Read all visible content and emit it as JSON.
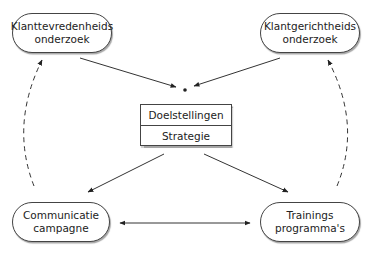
{
  "diagram": {
    "nodes": {
      "top_left": {
        "line1": "Klanttevredenheids",
        "line2": "onderzoek"
      },
      "top_right": {
        "line1": "Klantgerichtheids",
        "line2": "onderzoek"
      },
      "bottom_left": {
        "line1": "Communicatie",
        "line2": "campagne"
      },
      "bottom_right": {
        "line1": "Trainings",
        "line2": "programma's"
      }
    },
    "center": {
      "rows": [
        "Doelstellingen",
        "Strategie"
      ]
    },
    "edges": [
      {
        "from": "top_left",
        "to": "center_dot",
        "style": "solid"
      },
      {
        "from": "top_right",
        "to": "center_dot",
        "style": "solid"
      },
      {
        "from": "center",
        "to": "bottom_left",
        "style": "solid"
      },
      {
        "from": "center",
        "to": "bottom_right",
        "style": "solid"
      },
      {
        "from": "bottom_left",
        "to": "bottom_right",
        "style": "solid",
        "bidirectional": true
      },
      {
        "from": "bottom_left",
        "to": "top_left",
        "style": "dashed-curved"
      },
      {
        "from": "bottom_right",
        "to": "top_right",
        "style": "dashed-curved"
      }
    ],
    "colors": {
      "stroke": "#333333",
      "background": "#ffffff"
    }
  }
}
